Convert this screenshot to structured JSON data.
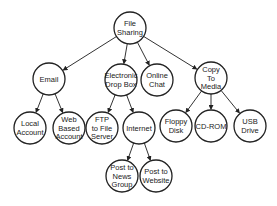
{
  "diagram": {
    "type": "tree",
    "nodes": [
      {
        "id": "root",
        "lines": [
          "File",
          "Sharing"
        ],
        "x": 130,
        "y": 28
      },
      {
        "id": "email",
        "lines": [
          "Email"
        ],
        "x": 49,
        "y": 79
      },
      {
        "id": "dropbox",
        "lines": [
          "Electronic",
          "Drop Box"
        ],
        "x": 121,
        "y": 80
      },
      {
        "id": "chat",
        "lines": [
          "Online",
          "Chat"
        ],
        "x": 157,
        "y": 80
      },
      {
        "id": "media",
        "lines": [
          "Copy",
          "To",
          "Media"
        ],
        "x": 211,
        "y": 78
      },
      {
        "id": "local",
        "lines": [
          "Local",
          "Account"
        ],
        "x": 30,
        "y": 128
      },
      {
        "id": "web",
        "lines": [
          "Web",
          "Based",
          "Account"
        ],
        "x": 69,
        "y": 128
      },
      {
        "id": "ftp",
        "lines": [
          "FTP",
          "to File",
          "Server"
        ],
        "x": 102,
        "y": 128
      },
      {
        "id": "internet",
        "lines": [
          "Internet"
        ],
        "x": 139,
        "y": 128
      },
      {
        "id": "floppy",
        "lines": [
          "Floppy",
          "Disk"
        ],
        "x": 176,
        "y": 126
      },
      {
        "id": "cdrom",
        "lines": [
          "CD-ROM"
        ],
        "x": 211,
        "y": 126
      },
      {
        "id": "usb",
        "lines": [
          "USB",
          "Drive"
        ],
        "x": 250,
        "y": 126
      },
      {
        "id": "news",
        "lines": [
          "Post to",
          "News",
          "Group"
        ],
        "x": 122,
        "y": 176
      },
      {
        "id": "website",
        "lines": [
          "Post to",
          "Website"
        ],
        "x": 156,
        "y": 176
      }
    ],
    "edges": [
      [
        "root",
        "email"
      ],
      [
        "root",
        "dropbox"
      ],
      [
        "root",
        "chat"
      ],
      [
        "root",
        "media"
      ],
      [
        "email",
        "local"
      ],
      [
        "email",
        "web"
      ],
      [
        "dropbox",
        "ftp"
      ],
      [
        "dropbox",
        "internet"
      ],
      [
        "media",
        "floppy"
      ],
      [
        "media",
        "cdrom"
      ],
      [
        "media",
        "usb"
      ],
      [
        "internet",
        "news"
      ],
      [
        "internet",
        "website"
      ]
    ],
    "radius": 16,
    "colors": {
      "stroke": "#222222",
      "fill": "#ffffff",
      "text": "#222222"
    }
  }
}
